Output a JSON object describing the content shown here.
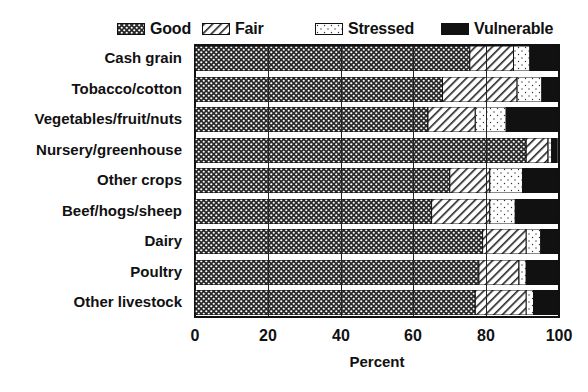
{
  "chart_data": {
    "type": "bar",
    "orientation": "horizontal",
    "stacked": true,
    "title": "",
    "xlabel": "Percent",
    "ylabel": "",
    "xlim": [
      0,
      100
    ],
    "xticks": [
      0,
      20,
      40,
      60,
      80,
      100
    ],
    "grid": true,
    "legend_position": "top",
    "categories": [
      "Cash grain",
      "Tobacco/cotton",
      "Vegetables/fruit/nuts",
      "Nursery/greenhouse",
      "Other crops",
      "Beef/hogs/sheep",
      "Dairy",
      "Poultry",
      "Other livestock"
    ],
    "series": [
      {
        "name": "Good",
        "pattern": "crosshatch",
        "values": [
          75.5,
          68,
          64,
          91,
          70,
          65,
          79,
          78,
          77
        ]
      },
      {
        "name": "Fair",
        "pattern": "diagonal-hatch",
        "values": [
          12,
          20.5,
          13,
          6,
          11,
          16,
          12,
          11,
          14
        ]
      },
      {
        "name": "Stressed",
        "pattern": "dots",
        "values": [
          4.5,
          6.8,
          8.5,
          1,
          9,
          7,
          4,
          2,
          2
        ]
      },
      {
        "name": "Vulnerable",
        "pattern": "solid-black",
        "values": [
          8,
          4.7,
          14.5,
          1.5,
          10,
          12,
          5,
          9,
          7
        ]
      }
    ]
  },
  "legend": {
    "items": [
      {
        "label": "Good"
      },
      {
        "label": "Fair"
      },
      {
        "label": "Stressed"
      },
      {
        "label": "Vulnerable"
      }
    ]
  },
  "axis": {
    "x_tick_labels": [
      "0",
      "20",
      "40",
      "60",
      "80",
      "100"
    ],
    "x_title": "Percent"
  },
  "colors": {
    "ink": "#111111",
    "background": "#ffffff"
  }
}
